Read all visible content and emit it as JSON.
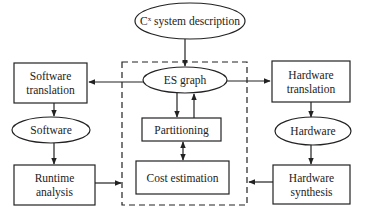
{
  "diagram": {
    "top": {
      "label_prefix": "C",
      "label_sup": "x",
      "label_rest": " system description"
    },
    "es_graph": "ES graph",
    "partitioning": "Partitioning",
    "cost_estimation": "Cost estimation",
    "software_translation": [
      "Software",
      "translation"
    ],
    "software": "Software",
    "runtime_analysis": [
      "Runtime",
      "analysis"
    ],
    "hardware_translation": [
      "Hardware",
      "translation"
    ],
    "hardware": "Hardware",
    "hardware_synthesis": [
      "Hardware",
      "synthesis"
    ]
  },
  "colors": {
    "stroke": "#222222",
    "background": "#ffffff"
  }
}
